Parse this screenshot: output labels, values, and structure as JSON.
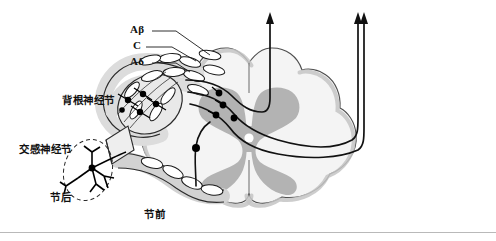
{
  "figure": {
    "type": "anatomical-diagram",
    "width": 496,
    "height": 241,
    "background_color": "#ffffff"
  },
  "labels": {
    "a_beta": "Aβ",
    "c_fiber": "C",
    "a_delta": "Aδ",
    "dorsal_root_ganglion": "背根神经节",
    "sympathetic_ganglion": "交感神经节",
    "postganglionic": "节后",
    "preganglionic": "节前"
  },
  "label_positions": {
    "a_beta": {
      "x": 130,
      "y": 29
    },
    "c_fiber": {
      "x": 133,
      "y": 45
    },
    "a_delta": {
      "x": 130,
      "y": 61
    },
    "dorsal_root_ganglion": {
      "x": 62,
      "y": 95
    },
    "sympathetic_ganglion": {
      "x": 19,
      "y": 144
    },
    "postganglionic": {
      "x": 50,
      "y": 192
    },
    "preganglionic": {
      "x": 144,
      "y": 209
    }
  },
  "colors": {
    "outline": "#1a1a1a",
    "white_matter_fill": "#f4f4f4",
    "white_matter_edge": "#5b5b5b",
    "gray_matter_fill": "#b3b3b3",
    "pia_band_fill": "#c9c9c9",
    "nerve_sheath_fill": "#dcdcdc",
    "myelin_segment_fill": "#ffffff",
    "neuron_soma": "#000000",
    "central_canal": "#ffffff",
    "rule_color": "#b9b9b9",
    "dashed_ellipse": "#2a2a2a"
  },
  "annotations": {
    "leader_lines": 3,
    "ascending_arrows": 3,
    "arrow_x_positions": [
      270,
      355,
      363
    ],
    "arrow_tip_y": 12
  },
  "rule": {
    "y": 232
  }
}
